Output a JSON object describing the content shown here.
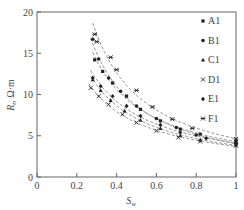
{
  "chart_data": {
    "type": "scatter",
    "title": "",
    "xlabel": "S_w",
    "ylabel": "R_t, Ω·m",
    "xlim": [
      0,
      1
    ],
    "ylim": [
      0,
      20
    ],
    "xticks": [
      "0",
      "0.2",
      "0.4",
      "0.6",
      "0.8",
      "1"
    ],
    "yticks": [
      "0",
      "5",
      "10",
      "15",
      "20"
    ],
    "grid": false,
    "legend_position": "upper right",
    "fit_lines": "dashed power-law fit per series",
    "series": [
      {
        "name": "A1",
        "marker": "square",
        "x": [
          0.29,
          0.33,
          0.38,
          0.45,
          0.52,
          0.62,
          0.72,
          0.82,
          1.0
        ],
        "y": [
          14.2,
          12.8,
          11.4,
          9.8,
          8.2,
          6.8,
          5.8,
          5.2,
          4.3
        ]
      },
      {
        "name": "B1",
        "marker": "circle",
        "x": [
          0.28,
          0.31,
          0.36,
          0.42,
          0.5,
          0.6,
          0.7,
          0.8,
          1.0
        ],
        "y": [
          16.7,
          14.3,
          12.0,
          10.4,
          8.6,
          7.1,
          6.0,
          5.1,
          4.1
        ]
      },
      {
        "name": "C1",
        "marker": "triangle",
        "x": [
          0.28,
          0.32,
          0.37,
          0.44,
          0.52,
          0.62,
          0.72,
          0.82,
          1.0
        ],
        "y": [
          11.8,
          10.5,
          9.3,
          8.0,
          6.9,
          5.9,
          5.0,
          4.5,
          3.9
        ]
      },
      {
        "name": "D1",
        "marker": "x",
        "x": [
          0.27,
          0.31,
          0.36,
          0.43,
          0.5,
          0.6,
          0.71,
          0.82,
          1.0
        ],
        "y": [
          10.8,
          9.8,
          8.8,
          7.6,
          6.6,
          5.6,
          4.8,
          4.3,
          3.8
        ]
      },
      {
        "name": "E1",
        "marker": "diamond",
        "x": [
          0.28,
          0.32,
          0.38,
          0.45,
          0.52,
          0.62,
          0.72,
          0.85,
          1.0
        ],
        "y": [
          12.0,
          11.0,
          9.8,
          8.6,
          7.4,
          6.3,
          5.4,
          4.7,
          4.0
        ]
      },
      {
        "name": "F1",
        "marker": "asterisk",
        "x": [
          0.29,
          0.3,
          0.37,
          0.4,
          0.5,
          0.58,
          0.68,
          0.78,
          1.0
        ],
        "y": [
          17.3,
          16.4,
          14.5,
          13.0,
          10.5,
          8.5,
          7.0,
          5.9,
          4.6
        ]
      }
    ]
  },
  "legend": {
    "items": [
      {
        "label": "A1",
        "symbol": "■"
      },
      {
        "label": "B1",
        "symbol": "●"
      },
      {
        "label": "C1",
        "symbol": "▲"
      },
      {
        "label": "D1",
        "symbol": "×"
      },
      {
        "label": "E1",
        "symbol": "◆"
      },
      {
        "label": "F1",
        "symbol": "✱"
      }
    ]
  },
  "axes": {
    "x_label_main": "S",
    "x_label_sub": "w",
    "y_label_main": "R",
    "y_label_sub": "t",
    "y_label_unit": ", Ω·m"
  }
}
